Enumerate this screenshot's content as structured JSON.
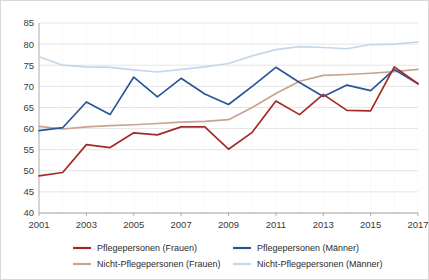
{
  "chart_data": {
    "type": "line",
    "title": "",
    "xlabel": "",
    "ylabel": "",
    "x": [
      2001,
      2002,
      2003,
      2004,
      2005,
      2006,
      2007,
      2008,
      2009,
      2010,
      2011,
      2012,
      2013,
      2014,
      2015,
      2016,
      2017
    ],
    "xtick_labels": [
      "2001",
      "2003",
      "2005",
      "2007",
      "2009",
      "2011",
      "2013",
      "2015",
      "2017"
    ],
    "xtick_values": [
      2001,
      2003,
      2005,
      2007,
      2009,
      2011,
      2013,
      2015,
      2017
    ],
    "ytick_labels": [
      "40",
      "45",
      "50",
      "55",
      "60",
      "65",
      "70",
      "75",
      "80",
      "85"
    ],
    "ytick_values": [
      40,
      45,
      50,
      55,
      60,
      65,
      70,
      75,
      80,
      85
    ],
    "ylim": [
      40,
      85
    ],
    "xlim": [
      2001,
      2017
    ],
    "grid": true,
    "legend_position": "bottom",
    "series": [
      {
        "name": "Pflegepersonen (Frauen)",
        "color": "#a32b27",
        "values": [
          48.8,
          49.6,
          56.2,
          55.5,
          59.0,
          58.5,
          60.4,
          60.4,
          55.1,
          59.1,
          66.5,
          63.3,
          68.1,
          64.3,
          64.2,
          74.6,
          70.6
        ]
      },
      {
        "name": "Pflegepersonen (Männer)",
        "color": "#2a5699",
        "values": [
          59.5,
          60.2,
          66.3,
          63.3,
          72.2,
          67.5,
          71.9,
          68.2,
          65.7,
          70.0,
          74.5,
          70.9,
          67.6,
          70.3,
          69.0,
          74.0,
          70.6
        ]
      },
      {
        "name": "Nicht-Pflegepersonen (Frauen)",
        "color": "#c9a48c",
        "values": [
          60.5,
          59.9,
          60.4,
          60.7,
          60.9,
          61.2,
          61.5,
          61.7,
          62.1,
          65.0,
          68.3,
          71.2,
          72.6,
          72.8,
          73.1,
          73.5,
          74.0
        ]
      },
      {
        "name": "Nicht-Pflegepersonen (Männer)",
        "color": "#c5d7e8",
        "values": [
          77.0,
          75.0,
          74.6,
          74.5,
          73.9,
          73.4,
          74.0,
          74.6,
          75.4,
          77.2,
          78.7,
          79.4,
          79.2,
          78.9,
          79.9,
          80.0,
          80.5
        ]
      }
    ]
  }
}
